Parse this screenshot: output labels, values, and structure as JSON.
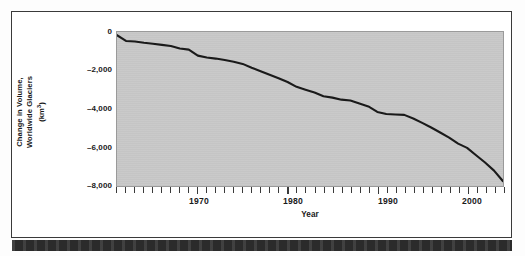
{
  "figure": {
    "background_color": "#ffffff",
    "frame_color": "#3a3a3a",
    "plot_fill_color": "#c9c9c9",
    "line_color": "#1a1a1a",
    "bottom_bar_color": "#2b2b2b"
  },
  "axis": {
    "y_title_line1": "Change in Volume,",
    "y_title_line2": "Worldwide Glaciers",
    "y_title_line3_prefix": "(km",
    "y_title_line3_sup": "3",
    "y_title_line3_suffix": ")",
    "x_title": "Year",
    "y_tick_labels": [
      "0",
      "–2,000",
      "–4,000",
      "–6,000",
      "–8,000"
    ],
    "y_tick_values": [
      0,
      -2000,
      -4000,
      -6000,
      -8000
    ],
    "x_tick_labels": [
      "1970",
      "1980",
      "1990",
      "2000"
    ],
    "x_tick_values": [
      1970,
      1980,
      1990,
      2000
    ]
  },
  "chart_data": {
    "type": "line",
    "title": "",
    "subtitle": "",
    "xlabel": "Year",
    "ylabel": "Change in Volume, Worldwide Glaciers (km3)",
    "xlim": [
      1961,
      2004
    ],
    "ylim": [
      -8400,
      0
    ],
    "xticks": [
      1970,
      1980,
      1990,
      2000
    ],
    "yticks": [
      0,
      -2000,
      -4000,
      -6000,
      -8000
    ],
    "xtick_labels": [
      "1970",
      "1980",
      "1990",
      "2000"
    ],
    "ytick_labels": [
      "0",
      "–2,000",
      "–4,000",
      "–6,000",
      "–8,000"
    ],
    "minor_xtick_interval": 1,
    "grid": false,
    "legend": false,
    "legend_position": "none",
    "series": [
      {
        "name": "Cumulative change in volume, worldwide glaciers",
        "units": "km3",
        "x": [
          1961,
          1962,
          1963,
          1964,
          1965,
          1966,
          1967,
          1968,
          1969,
          1970,
          1971,
          1972,
          1973,
          1974,
          1975,
          1976,
          1977,
          1978,
          1979,
          1980,
          1981,
          1982,
          1983,
          1984,
          1985,
          1986,
          1987,
          1988,
          1989,
          1990,
          1991,
          1992,
          1993,
          1994,
          1995,
          1996,
          1997,
          1998,
          1999,
          2000,
          1991.5,
          2001,
          2002,
          2003,
          2004
        ],
        "values": [
          -175,
          -490,
          -520,
          -590,
          -640,
          -700,
          -760,
          -900,
          -960,
          -1290,
          -1390,
          -1450,
          -1530,
          -1620,
          -1740,
          -1950,
          -2140,
          -2330,
          -2520,
          -2730,
          -2990,
          -3150,
          -3300,
          -3500,
          -3580,
          -3690,
          -3740,
          -3900,
          -4060,
          -4360,
          -4470,
          -4500,
          -4520,
          -4720,
          -4960,
          -5210,
          -5480,
          -5760,
          -6090,
          -6320,
          -4480,
          -6720,
          -7120,
          -7560,
          -8140
        ]
      }
    ],
    "points": [
      {
        "x": 1961,
        "y": -175
      },
      {
        "x": 1962,
        "y": -490
      },
      {
        "x": 1963,
        "y": -520
      },
      {
        "x": 1964,
        "y": -590
      },
      {
        "x": 1965,
        "y": -640
      },
      {
        "x": 1966,
        "y": -700
      },
      {
        "x": 1967,
        "y": -760
      },
      {
        "x": 1968,
        "y": -900
      },
      {
        "x": 1969,
        "y": -960
      },
      {
        "x": 1970,
        "y": -1290
      },
      {
        "x": 1971,
        "y": -1390
      },
      {
        "x": 1972,
        "y": -1450
      },
      {
        "x": 1973,
        "y": -1530
      },
      {
        "x": 1974,
        "y": -1620
      },
      {
        "x": 1975,
        "y": -1740
      },
      {
        "x": 1976,
        "y": -1950
      },
      {
        "x": 1977,
        "y": -2140
      },
      {
        "x": 1978,
        "y": -2330
      },
      {
        "x": 1979,
        "y": -2520
      },
      {
        "x": 1980,
        "y": -2730
      },
      {
        "x": 1981,
        "y": -2990
      },
      {
        "x": 1982,
        "y": -3150
      },
      {
        "x": 1983,
        "y": -3300
      },
      {
        "x": 1984,
        "y": -3500
      },
      {
        "x": 1985,
        "y": -3580
      },
      {
        "x": 1986,
        "y": -3690
      },
      {
        "x": 1987,
        "y": -3740
      },
      {
        "x": 1988,
        "y": -3900
      },
      {
        "x": 1989,
        "y": -4060
      },
      {
        "x": 1990,
        "y": -4360
      },
      {
        "x": 1991,
        "y": -4470
      },
      {
        "x": 1992,
        "y": -4500
      },
      {
        "x": 1993,
        "y": -4520
      },
      {
        "x": 1994,
        "y": -4720
      },
      {
        "x": 1995,
        "y": -4960
      },
      {
        "x": 1996,
        "y": -5210
      },
      {
        "x": 1997,
        "y": -5480
      },
      {
        "x": 1998,
        "y": -5760
      },
      {
        "x": 1999,
        "y": -6090
      },
      {
        "x": 2000,
        "y": -6320
      },
      {
        "x": 2001,
        "y": -6720
      },
      {
        "x": 2002,
        "y": -7120
      },
      {
        "x": 2003,
        "y": -7560
      },
      {
        "x": 2004,
        "y": -8140
      }
    ]
  }
}
